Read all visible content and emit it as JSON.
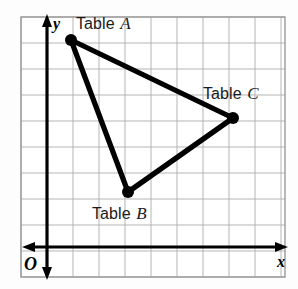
{
  "figure": {
    "type": "coordinate-grid-diagram",
    "background_color": "#fdfdfd",
    "grid_color": "#b9b9b9",
    "axis_color": "#000000",
    "line_color": "#000000"
  },
  "axes": {
    "x_label": "x",
    "y_label": "y",
    "origin_label": "O",
    "x_axis_y_px": 247,
    "y_axis_x_px": 47
  },
  "grid": {
    "left_px": 21,
    "top_px": 17,
    "right_px": 285,
    "bottom_px": 277,
    "cell_px": 26,
    "columns": 10,
    "rows": 10
  },
  "labels": {
    "table_a_prefix": "Table ",
    "table_a_letter": "A",
    "table_b_prefix": "Table ",
    "table_b_letter": "B",
    "table_c_prefix": "Table ",
    "table_c_letter": "C"
  },
  "chart_data": {
    "type": "scatter",
    "title": "",
    "xlabel": "x",
    "ylabel": "y",
    "grid": true,
    "legend": null,
    "annotations": [
      "Table A",
      "Table B",
      "Table C",
      "O",
      "x",
      "y"
    ],
    "shape": "triangle",
    "points": [
      {
        "name": "Table A",
        "px": [
          71,
          40
        ],
        "grid": [
          1,
          8
        ]
      },
      {
        "name": "Table B",
        "px": [
          128,
          192
        ],
        "grid": [
          3,
          2
        ]
      },
      {
        "name": "Table C",
        "px": [
          233,
          118
        ],
        "grid": [
          7,
          5
        ]
      }
    ],
    "edges": [
      [
        "Table A",
        "Table C"
      ],
      [
        "Table A",
        "Table B"
      ],
      [
        "Table B",
        "Table C"
      ]
    ]
  }
}
